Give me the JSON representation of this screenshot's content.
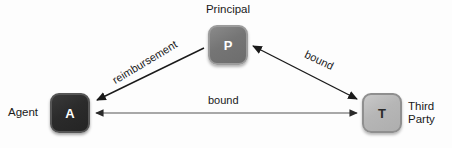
{
  "diagram": {
    "title_context": "agency relationship triangle",
    "background_color": "#fdfdfd",
    "nodes": [
      {
        "id": "principal",
        "glyph": "P",
        "caption": "Principal",
        "fill_color": "#757575",
        "text_color": "#ffffff",
        "x": 208,
        "y": 25,
        "w": 40,
        "h": 40
      },
      {
        "id": "agent",
        "glyph": "A",
        "caption": "Agent",
        "fill_color": "#2b2b2b",
        "text_color": "#ffffff",
        "x": 50,
        "y": 93,
        "w": 40,
        "h": 40
      },
      {
        "id": "third-party",
        "glyph": "T",
        "caption": "Third\nParty",
        "caption_line1": "Third",
        "caption_line2": "Party",
        "fill_color": "#b6b6b6",
        "text_color": "#2a2a2a",
        "x": 362,
        "y": 93,
        "w": 40,
        "h": 40
      }
    ],
    "edges": [
      {
        "id": "principal-to-agent",
        "from": "principal",
        "to": "agent",
        "label": "reimbursement",
        "direction": "one-way",
        "arrow_at": "agent",
        "stroke_color": "#1a1a1a"
      },
      {
        "id": "principal-third-party",
        "from": "principal",
        "to": "third-party",
        "label": "bound",
        "direction": "two-way",
        "arrow_at": "both",
        "stroke_color": "#1a1a1a"
      },
      {
        "id": "agent-third-party",
        "from": "agent",
        "to": "third-party",
        "label": "bound",
        "direction": "two-way",
        "arrow_at": "both",
        "stroke_color": "#555555"
      }
    ]
  }
}
